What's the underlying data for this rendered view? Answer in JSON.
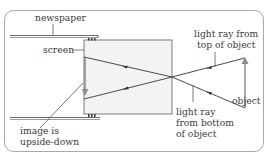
{
  "diagram": {
    "labels": {
      "newspaper": "newspaper",
      "screen": "screen",
      "ray_top_line1": "light ray from",
      "ray_top_line2": "top of object",
      "ray_bottom_line1": "light ray",
      "ray_bottom_line2": "from bottom",
      "ray_bottom_line3": "of object",
      "object": "object",
      "image_line1": "image is",
      "image_line2": "upside-down"
    },
    "colors": {
      "frame": "#9a9a9a",
      "line": "#4a4a4a",
      "screen_fill": "#f3f3f3",
      "arrow": "#8c8c8c"
    }
  }
}
